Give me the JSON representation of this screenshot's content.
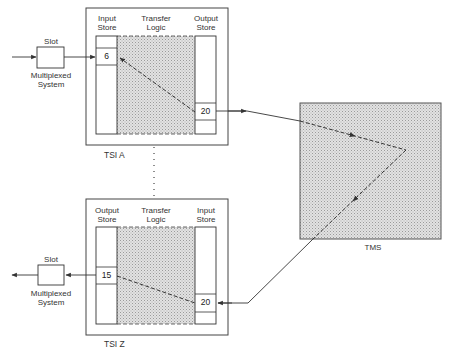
{
  "diagram": {
    "tsi_a": {
      "label": "TSI A",
      "columns": {
        "left": {
          "line1": "Input",
          "line2": "Store"
        },
        "middle": {
          "line1": "Transfer",
          "line2": "Logic"
        },
        "right": {
          "line1": "Output",
          "line2": "Store"
        }
      },
      "left_cell_value": "6",
      "right_cell_value": "20"
    },
    "tsi_z": {
      "label": "TSI Z",
      "columns": {
        "left": {
          "line1": "Output",
          "line2": "Store"
        },
        "middle": {
          "line1": "Transfer",
          "line2": "Logic"
        },
        "right": {
          "line1": "Input",
          "line2": "Store"
        }
      },
      "left_cell_value": "15",
      "right_cell_value": "20"
    },
    "slot_top": {
      "title": "Slot",
      "caption_line1": "Multiplexed",
      "caption_line2": "System"
    },
    "slot_bottom": {
      "title": "Slot",
      "caption_line1": "Multiplexed",
      "caption_line2": "System"
    },
    "tms": {
      "label": "TMS"
    },
    "colors": {
      "stroke": "#333333",
      "shade": "#d6d6d6",
      "background": "#ffffff"
    }
  }
}
